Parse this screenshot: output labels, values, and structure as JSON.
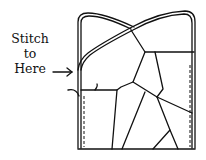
{
  "diagram": {
    "label_lines": [
      "Stitch",
      "to",
      "Here"
    ],
    "arrow_icon": "right-arrow",
    "line_color": "#111111",
    "background": "#ffffff"
  }
}
